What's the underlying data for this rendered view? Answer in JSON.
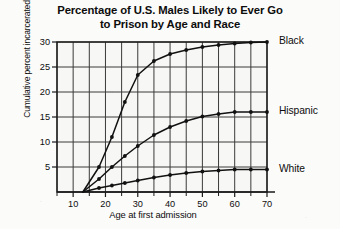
{
  "chart_data": {
    "type": "line",
    "title": "Percentage of U.S. Males Likely to Ever Go\nto Prison by Age and Race",
    "xlabel": "Age at first admission",
    "ylabel": "Cumulative percent incarcerated",
    "xlim": [
      5,
      70
    ],
    "ylim": [
      0,
      30
    ],
    "xticks": [
      10,
      20,
      30,
      40,
      50,
      60,
      70
    ],
    "xtick_labels": [
      "10",
      "20",
      "30",
      "40",
      "50",
      "60",
      "70"
    ],
    "xminor_ticks": [
      5,
      15,
      25,
      35,
      45,
      55,
      65
    ],
    "yticks": [
      5,
      10,
      15,
      20,
      25,
      30
    ],
    "ytick_labels": [
      "5",
      "10",
      "15",
      "20",
      "25",
      "30"
    ],
    "grid": true,
    "grid_color": "#3a3a3a",
    "legend_position": "right-of-line-end",
    "line_color": "#111111",
    "marker": "filled-circle",
    "x": [
      13,
      18,
      22,
      26,
      30,
      35,
      40,
      45,
      50,
      55,
      60,
      65,
      70
    ],
    "series": [
      {
        "name": "Black",
        "label": "Black",
        "values": [
          0,
          5.0,
          11.0,
          18.0,
          23.4,
          26.2,
          27.6,
          28.4,
          29.0,
          29.4,
          29.7,
          29.9,
          30.0
        ]
      },
      {
        "name": "Hispanic",
        "label": "Hispanic",
        "values": [
          0,
          2.6,
          5.0,
          7.2,
          9.2,
          11.4,
          13.0,
          14.2,
          15.1,
          15.6,
          16.0,
          16.0,
          16.0
        ]
      },
      {
        "name": "White",
        "label": "White",
        "values": [
          0,
          0.8,
          1.3,
          1.8,
          2.3,
          2.9,
          3.4,
          3.8,
          4.1,
          4.3,
          4.5,
          4.5,
          4.5
        ]
      }
    ]
  }
}
